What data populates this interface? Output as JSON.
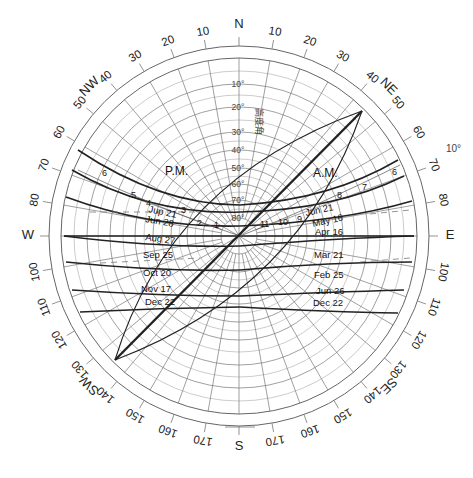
{
  "diagram": {
    "type": "sun-path-diagram",
    "center": [
      239,
      236
    ],
    "inner_radius": 178,
    "outer_radius": 190,
    "cardinal_labels": [
      {
        "text": "N",
        "azimuth": 0
      },
      {
        "text": "NE",
        "azimuth": 45
      },
      {
        "text": "E",
        "azimuth": 90
      },
      {
        "text": "SE",
        "azimuth": 135
      },
      {
        "text": "S",
        "azimuth": 180
      },
      {
        "text": "SW",
        "azimuth": 225
      },
      {
        "text": "W",
        "azimuth": 270
      },
      {
        "text": "NW",
        "azimuth": 315
      }
    ],
    "azimuth_labels": [
      {
        "text": "10",
        "azimuth": 10
      },
      {
        "text": "20",
        "azimuth": 20
      },
      {
        "text": "30",
        "azimuth": 30
      },
      {
        "text": "40",
        "azimuth": 40
      },
      {
        "text": "50",
        "azimuth": 50
      },
      {
        "text": "60",
        "azimuth": 60
      },
      {
        "text": "70",
        "azimuth": 70
      },
      {
        "text": "80",
        "azimuth": 80
      },
      {
        "text": "100",
        "azimuth": 100
      },
      {
        "text": "110",
        "azimuth": 110
      },
      {
        "text": "120",
        "azimuth": 120
      },
      {
        "text": "130",
        "azimuth": 130
      },
      {
        "text": "140",
        "azimuth": 140
      },
      {
        "text": "150",
        "azimuth": 150
      },
      {
        "text": "160",
        "azimuth": 160
      },
      {
        "text": "170",
        "azimuth": 170
      },
      {
        "text": "170",
        "azimuth": 190
      },
      {
        "text": "160",
        "azimuth": 200
      },
      {
        "text": "150",
        "azimuth": 210
      },
      {
        "text": "140",
        "azimuth": 220
      },
      {
        "text": "130",
        "azimuth": 230
      },
      {
        "text": "120",
        "azimuth": 240
      },
      {
        "text": "110",
        "azimuth": 250
      },
      {
        "text": "100",
        "azimuth": 260
      },
      {
        "text": "80",
        "azimuth": 280
      },
      {
        "text": "70",
        "azimuth": 290
      },
      {
        "text": "60",
        "azimuth": 300
      },
      {
        "text": "50",
        "azimuth": 310
      },
      {
        "text": "40",
        "azimuth": 320
      },
      {
        "text": "30",
        "azimuth": 330
      },
      {
        "text": "20",
        "azimuth": 340
      },
      {
        "text": "10",
        "azimuth": 350
      }
    ],
    "altitude_labels": [
      {
        "text": "10°",
        "radius": 152
      },
      {
        "text": "20°",
        "radius": 129
      },
      {
        "text": "30°",
        "radius": 104
      },
      {
        "text": "40°",
        "radius": 86
      },
      {
        "text": "50°",
        "radius": 68
      },
      {
        "text": "60°",
        "radius": 52
      },
      {
        "text": "70°",
        "radius": 36
      },
      {
        "text": "80°",
        "radius": 18
      }
    ],
    "altitude_axis_title": "高度角",
    "side_note": "10°",
    "period_labels": {
      "pm": "P.M.",
      "am": "A.M."
    },
    "date_labels_left": [
      "Jup 21",
      "Jun 28",
      "Aug 27",
      "Sep 25",
      "Oct 20",
      "Nov 17",
      "Dec 22"
    ],
    "date_labels_right": [
      "Jun 21",
      "May 16",
      "Apr 16",
      "Mar 21",
      "Feb 25",
      "Jun 26",
      "Dec 22"
    ],
    "hour_labels_pm": [
      "6",
      "5",
      "4",
      "3",
      "2",
      "1"
    ],
    "hour_labels_am": [
      "6",
      "7",
      "8",
      "9",
      "10",
      "11"
    ]
  }
}
